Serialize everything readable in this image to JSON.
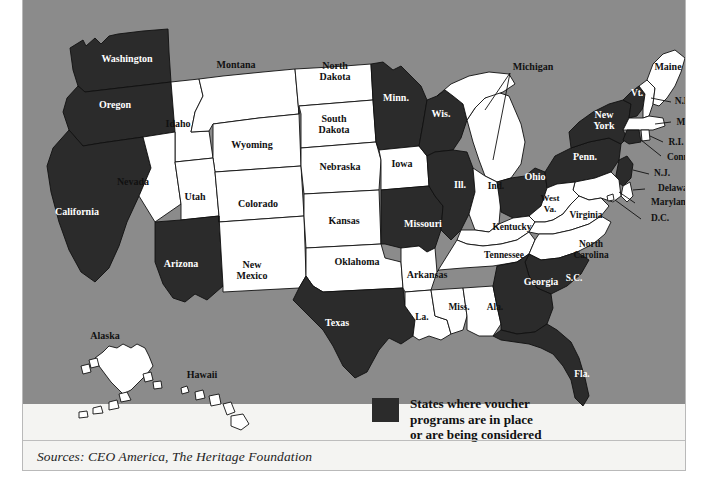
{
  "figure": {
    "kind": "choropleth-map",
    "region": "United States",
    "background_color": "#8b8b8b",
    "shaded_color": "#2b2b2b",
    "unshaded_color": "#ffffff",
    "border_color": "#111111"
  },
  "legend": {
    "swatch_color": "#2b2b2b",
    "text": "States where voucher\nprograms are in place\nor are being considered",
    "line1": "States where voucher",
    "line2": "programs are in place",
    "line3": "or are being considered"
  },
  "source": {
    "text": "Sources: CEO America, The Heritage Foundation"
  },
  "map": {
    "shaded_states": [
      "Washington",
      "Oregon",
      "California",
      "Arizona",
      "Texas",
      "Minn.",
      "Wis.",
      "Ill.",
      "Missouri",
      "Ohio",
      "Penn.",
      "New York",
      "Vt.",
      "Conn.",
      "N.J.",
      "Georgia",
      "S.C.",
      "Fla."
    ],
    "unshaded_states": [
      "Idaho",
      "Montana",
      "North Dakota",
      "South Dakota",
      "Wyoming",
      "Nebraska",
      "Nevada",
      "Utah",
      "Colorado",
      "Kansas",
      "New Mexico",
      "Oklahoma",
      "Iowa",
      "Arkansas",
      "La.",
      "Miss.",
      "Ala.",
      "Tennessee",
      "Kentucky",
      "Ind.",
      "Michigan",
      "West Va.",
      "Virginia",
      "North Carolina",
      "Maine",
      "N.H.",
      "Mass.",
      "R.I.",
      "Delaware",
      "Maryland",
      "D.C.",
      "Alaska",
      "Hawaii"
    ],
    "labels": [
      {
        "name": "Washington",
        "lines": [
          "Washington"
        ],
        "x": 104,
        "y": 62,
        "shade": "dark",
        "size": "s12"
      },
      {
        "name": "Oregon",
        "lines": [
          "Oregon"
        ],
        "x": 92,
        "y": 108,
        "shade": "dark",
        "size": "s12"
      },
      {
        "name": "California",
        "lines": [
          "California"
        ],
        "x": 54,
        "y": 215,
        "shade": "dark",
        "size": "s12"
      },
      {
        "name": "Nevada",
        "lines": [
          "Nevada"
        ],
        "x": 110,
        "y": 185,
        "shade": "lite",
        "size": "s12"
      },
      {
        "name": "Idaho",
        "lines": [
          "Idaho"
        ],
        "x": 155,
        "y": 127,
        "shade": "lite",
        "size": "s12"
      },
      {
        "name": "Montana",
        "lines": [
          "Montana"
        ],
        "x": 213,
        "y": 68,
        "shade": "lite",
        "size": "s12"
      },
      {
        "name": "Wyoming",
        "lines": [
          "Wyoming"
        ],
        "x": 229,
        "y": 148,
        "shade": "lite",
        "size": "s12"
      },
      {
        "name": "Utah",
        "lines": [
          "Utah"
        ],
        "x": 172,
        "y": 200,
        "shade": "lite",
        "size": "s12"
      },
      {
        "name": "Arizona",
        "lines": [
          "Arizona"
        ],
        "x": 158,
        "y": 267,
        "shade": "dark",
        "size": "s12"
      },
      {
        "name": "Colorado",
        "lines": [
          "Colorado"
        ],
        "x": 235,
        "y": 207,
        "shade": "lite",
        "size": "s12"
      },
      {
        "name": "New Mexico",
        "lines": [
          "New",
          "Mexico"
        ],
        "x": 229,
        "y": 268,
        "shade": "lite",
        "size": "s12"
      },
      {
        "name": "North Dakota",
        "lines": [
          "North",
          "Dakota"
        ],
        "x": 312,
        "y": 69,
        "shade": "lite",
        "size": "s12"
      },
      {
        "name": "South Dakota",
        "lines": [
          "South",
          "Dakota"
        ],
        "x": 311,
        "y": 122,
        "shade": "lite",
        "size": "s12"
      },
      {
        "name": "Nebraska",
        "lines": [
          "Nebraska"
        ],
        "x": 317,
        "y": 170,
        "shade": "lite",
        "size": "s12"
      },
      {
        "name": "Kansas",
        "lines": [
          "Kansas"
        ],
        "x": 321,
        "y": 224,
        "shade": "lite",
        "size": "s12"
      },
      {
        "name": "Oklahoma",
        "lines": [
          "Oklahoma"
        ],
        "x": 334,
        "y": 265,
        "shade": "lite",
        "size": "s12"
      },
      {
        "name": "Texas",
        "lines": [
          "Texas"
        ],
        "x": 314,
        "y": 326,
        "shade": "dark",
        "size": "s12"
      },
      {
        "name": "Minn.",
        "lines": [
          "Minn."
        ],
        "x": 373,
        "y": 101,
        "shade": "dark",
        "size": "s12"
      },
      {
        "name": "Iowa",
        "lines": [
          "Iowa"
        ],
        "x": 379,
        "y": 167,
        "shade": "lite",
        "size": "s12"
      },
      {
        "name": "Missouri",
        "lines": [
          "Missouri"
        ],
        "x": 400,
        "y": 227,
        "shade": "dark",
        "size": "s12"
      },
      {
        "name": "Arkansas",
        "lines": [
          "Arkansas"
        ],
        "x": 404,
        "y": 278,
        "shade": "lite",
        "size": "s12"
      },
      {
        "name": "La.",
        "lines": [
          "La."
        ],
        "x": 399,
        "y": 320,
        "shade": "lite",
        "size": "s11"
      },
      {
        "name": "Wis.",
        "lines": [
          "Wis."
        ],
        "x": 418,
        "y": 117,
        "shade": "dark",
        "size": "s12"
      },
      {
        "name": "Ill.",
        "lines": [
          "Ill."
        ],
        "x": 437,
        "y": 188,
        "shade": "dark",
        "size": "s12"
      },
      {
        "name": "Miss.",
        "lines": [
          "Miss."
        ],
        "x": 436,
        "y": 310,
        "shade": "lite",
        "size": "s11"
      },
      {
        "name": "Michigan",
        "lines": [
          "Michigan"
        ],
        "x": 510,
        "y": 70,
        "shade": "lite",
        "size": "s12"
      },
      {
        "name": "Ind.",
        "lines": [
          "Ind."
        ],
        "x": 473,
        "y": 189,
        "shade": "lite",
        "size": "s11"
      },
      {
        "name": "Kentucky",
        "lines": [
          "Kentucky"
        ],
        "x": 489,
        "y": 230,
        "shade": "lite",
        "size": "s11"
      },
      {
        "name": "Tennessee",
        "lines": [
          "Tennessee"
        ],
        "x": 481,
        "y": 258,
        "shade": "lite",
        "size": "s11"
      },
      {
        "name": "Ala.",
        "lines": [
          "Ala."
        ],
        "x": 472,
        "y": 310,
        "shade": "lite",
        "size": "s11"
      },
      {
        "name": "Ohio",
        "lines": [
          "Ohio"
        ],
        "x": 512,
        "y": 180,
        "shade": "dark",
        "size": "s12"
      },
      {
        "name": "West Va.",
        "lines": [
          "West",
          "Va."
        ],
        "x": 527,
        "y": 201,
        "shade": "lite",
        "size": "s10"
      },
      {
        "name": "Virginia",
        "lines": [
          "Virginia"
        ],
        "x": 563,
        "y": 218,
        "shade": "lite",
        "size": "s11"
      },
      {
        "name": "Georgia",
        "lines": [
          "Georgia"
        ],
        "x": 518,
        "y": 285,
        "shade": "dark",
        "size": "s12"
      },
      {
        "name": "S.C.",
        "lines": [
          "S.C."
        ],
        "x": 551,
        "y": 281,
        "shade": "dark",
        "size": "s11"
      },
      {
        "name": "Fla.",
        "lines": [
          "Fla."
        ],
        "x": 559,
        "y": 377,
        "shade": "dark",
        "size": "s11"
      },
      {
        "name": "North Carolina",
        "lines": [
          "North",
          "Carolina"
        ],
        "x": 568,
        "y": 247,
        "shade": "lite",
        "size": "s11"
      },
      {
        "name": "Penn.",
        "lines": [
          "Penn."
        ],
        "x": 562,
        "y": 160,
        "shade": "dark",
        "size": "s12"
      },
      {
        "name": "New York",
        "lines": [
          "New",
          "York"
        ],
        "x": 581,
        "y": 118,
        "shade": "dark",
        "size": "s12"
      },
      {
        "name": "Vt.",
        "lines": [
          "Vt."
        ],
        "x": 614,
        "y": 96,
        "shade": "dark",
        "size": "s11"
      },
      {
        "name": "Maine",
        "lines": [
          "Maine"
        ],
        "x": 645,
        "y": 70,
        "shade": "lite",
        "size": "s12"
      },
      {
        "name": "N.H.",
        "lines": [
          "N.H."
        ],
        "x": 661,
        "y": 104,
        "shade": "lite",
        "size": "s11"
      },
      {
        "name": "Mass.",
        "lines": [
          "Mass."
        ],
        "x": 665,
        "y": 125,
        "shade": "lite",
        "size": "s11"
      },
      {
        "name": "R.I.",
        "lines": [
          "R.I."
        ],
        "x": 653,
        "y": 145,
        "shade": "lite",
        "size": "s11"
      },
      {
        "name": "Conn.",
        "lines": [
          "Conn."
        ],
        "x": 656,
        "y": 160,
        "shade": "lite",
        "size": "s11"
      },
      {
        "name": "N.J.",
        "lines": [
          "N.J."
        ],
        "x": 639,
        "y": 176,
        "shade": "lite",
        "size": "s11"
      },
      {
        "name": "Delaware",
        "lines": [
          "Delaware"
        ],
        "x": 654,
        "y": 191,
        "shade": "lite",
        "size": "s11"
      },
      {
        "name": "Maryland",
        "lines": [
          "Maryland"
        ],
        "x": 648,
        "y": 205,
        "shade": "lite",
        "size": "s11"
      },
      {
        "name": "D.C.",
        "lines": [
          "D.C."
        ],
        "x": 637,
        "y": 221,
        "shade": "lite",
        "size": "s11"
      },
      {
        "name": "Alaska",
        "lines": [
          "Alaska"
        ],
        "x": 82,
        "y": 339,
        "shade": "lite",
        "size": "s12"
      },
      {
        "name": "Hawaii",
        "lines": [
          "Hawaii"
        ],
        "x": 179,
        "y": 378,
        "shade": "lite",
        "size": "s12"
      }
    ]
  }
}
